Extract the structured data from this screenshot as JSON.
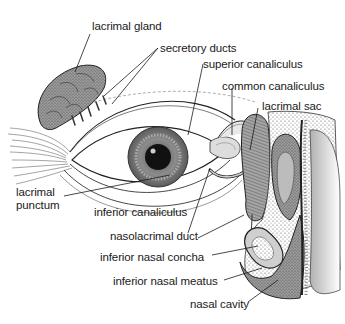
{
  "diagram": {
    "style": "black-and-white anatomical line illustration",
    "colors": {
      "background": "#ffffff",
      "ink": "#1a1a1a",
      "gland_fill": "#8a8a8a",
      "iris": "#7a7a7a",
      "pupil": "#111111",
      "sac_fill": "#9a9a9a",
      "bone_stipple": "#b5b5b5"
    },
    "labels": [
      {
        "id": "lacrimal-gland",
        "text": "lacrimal gland"
      },
      {
        "id": "secretory-ducts",
        "text": "secretory ducts"
      },
      {
        "id": "superior-canaliculus",
        "text": "superior canaliculus"
      },
      {
        "id": "common-canaliculus",
        "text": "common canaliculus"
      },
      {
        "id": "lacrimal-sac",
        "text": "lacrimal sac"
      },
      {
        "id": "lacrimal-punctum",
        "text": "lacrimal\npunctum"
      },
      {
        "id": "inferior-canaliculus",
        "text": "inferior canaliculus"
      },
      {
        "id": "nasolacrimal-duct",
        "text": "nasolacrimal duct"
      },
      {
        "id": "inferior-nasal-concha",
        "text": "inferior nasal concha"
      },
      {
        "id": "inferior-nasal-meatus",
        "text": "inferior nasal meatus"
      },
      {
        "id": "nasal-cavity",
        "text": "nasal cavity"
      }
    ]
  }
}
